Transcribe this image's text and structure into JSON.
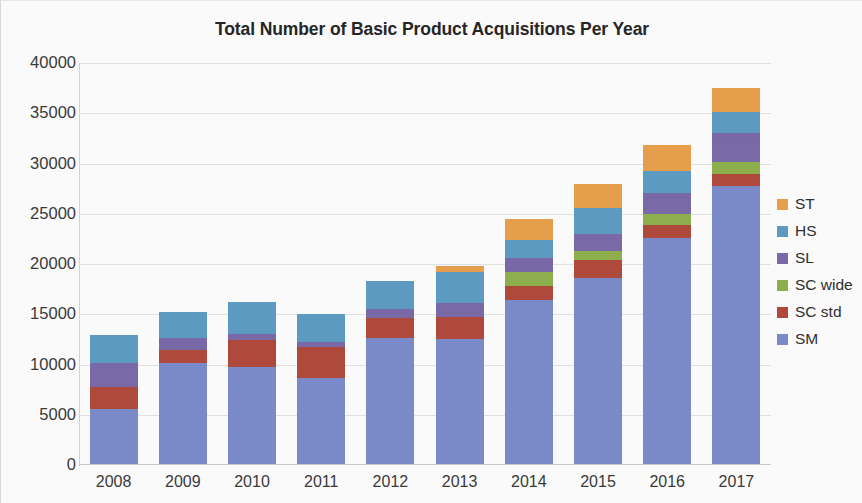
{
  "chart_data": {
    "type": "bar",
    "subtype": "stacked-column",
    "title": "Total Number of Basic Product Acquisitions Per Year",
    "xlabel": "",
    "ylabel": "",
    "ylim": [
      0,
      40000
    ],
    "ytick_step": 5000,
    "ytick_labels": [
      "40000",
      "35000",
      "30000",
      "25000",
      "20000",
      "15000",
      "10000",
      "5000",
      "0"
    ],
    "ytick_values": [
      40000,
      35000,
      30000,
      25000,
      20000,
      15000,
      10000,
      5000,
      0
    ],
    "grid": true,
    "grid_axis": "y",
    "legend_position": "right",
    "categories": [
      "2008",
      "2009",
      "2010",
      "2011",
      "2012",
      "2013",
      "2014",
      "2015",
      "2016",
      "2017"
    ],
    "series": [
      {
        "name": "SM",
        "color": "#7b8ccb",
        "values": [
          5600,
          10200,
          9800,
          8700,
          12600,
          12500,
          16400,
          18600,
          22600,
          27800
        ]
      },
      {
        "name": "SC std",
        "color": "#b04a3c",
        "values": [
          2200,
          1200,
          2600,
          3000,
          2000,
          2200,
          1400,
          1800,
          1300,
          1200
        ]
      },
      {
        "name": "SC wide",
        "color": "#8fb04e",
        "values": [
          0,
          0,
          0,
          0,
          0,
          0,
          1400,
          900,
          1100,
          1200
        ]
      },
      {
        "name": "SL",
        "color": "#7a6aa8",
        "values": [
          2400,
          1200,
          600,
          500,
          900,
          1400,
          1400,
          1700,
          2100,
          2800
        ]
      },
      {
        "name": "HS",
        "color": "#5e9cc4",
        "values": [
          2700,
          2600,
          3200,
          2800,
          2800,
          3100,
          1800,
          2600,
          2200,
          2100
        ]
      },
      {
        "name": "ST",
        "color": "#e8a04c",
        "values": [
          0,
          0,
          0,
          0,
          0,
          600,
          2100,
          2400,
          2500,
          2400
        ]
      }
    ],
    "totals": [
      12900,
      15200,
      16200,
      15000,
      18300,
      19800,
      24500,
      28000,
      31800,
      37500
    ],
    "legend_entries": [
      {
        "label": "ST",
        "color": "#e8a04c"
      },
      {
        "label": "HS",
        "color": "#5e9cc4"
      },
      {
        "label": "SL",
        "color": "#7a6aa8"
      },
      {
        "label": "SC wide",
        "color": "#8fb04e"
      },
      {
        "label": "SC std",
        "color": "#b04a3c"
      },
      {
        "label": "SM",
        "color": "#7b8ccb"
      }
    ]
  }
}
